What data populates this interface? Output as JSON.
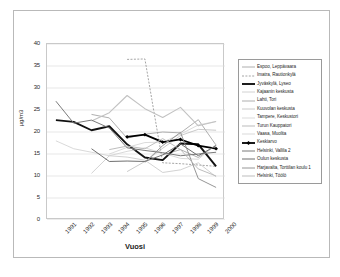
{
  "chart_data": {
    "type": "line",
    "title": "",
    "xlabel": "Vuosi",
    "ylabel": "µg/m3",
    "x": [
      1991,
      1992,
      1993,
      1994,
      1995,
      1996,
      1997,
      1998,
      1999,
      2000
    ],
    "categories": [
      "1991",
      "1992",
      "1993",
      "1994",
      "1995",
      "1996",
      "1997",
      "1998",
      "1999",
      "2000"
    ],
    "ylim": [
      0,
      40
    ],
    "yticks": [
      0,
      5,
      10,
      15,
      20,
      25,
      30,
      35,
      40
    ],
    "grid": "horizontal",
    "legend_position": "right",
    "series": [
      {
        "name": "Espoo, Leppävaara",
        "color": "#9a9a9a",
        "width": 0.8,
        "dash": "",
        "marker": "none",
        "values": [
          null,
          null,
          null,
          null,
          null,
          null,
          14.8,
          16.0,
          14.2,
          17.0
        ]
      },
      {
        "name": "Imatra, Rautionkylä",
        "color": "#8e8e8e",
        "width": 0.8,
        "dash": "2,1.4",
        "marker": "none",
        "values": [
          null,
          null,
          null,
          null,
          36.5,
          36.6,
          13.0,
          12.8,
          12.5,
          12.2
        ]
      },
      {
        "name": "Jyväskylä, Lyseo",
        "color": "#111111",
        "width": 1.9,
        "dash": "",
        "marker": "none",
        "values": [
          22.7,
          22.3,
          20.4,
          21.3,
          17.2,
          14.2,
          13.6,
          17.4,
          17.2,
          12.2
        ]
      },
      {
        "name": "Kajaanin keskusta",
        "color": "#c6c6c6",
        "width": 0.8,
        "dash": "",
        "marker": "none",
        "values": [
          null,
          null,
          10.6,
          14.6,
          14.3,
          13.6,
          10.8,
          11.4,
          13.0,
          9.8
        ]
      },
      {
        "name": "Lahti, Tori",
        "color": "#a6a6a6",
        "width": 0.9,
        "dash": "",
        "marker": "none",
        "values": [
          null,
          null,
          24.0,
          23.2,
          18.6,
          19.5,
          20.0,
          19.8,
          22.8,
          17.0
        ]
      },
      {
        "name": "Kuuvolan keskusta",
        "color": "#bdbdbd",
        "width": 0.8,
        "dash": "",
        "marker": "none",
        "values": [
          null,
          null,
          null,
          null,
          11.0,
          13.3,
          16.3,
          19.2,
          20.6,
          20.4
        ]
      },
      {
        "name": "Tampere, Keskustori",
        "color": "#d2d2d2",
        "width": 0.8,
        "dash": "",
        "marker": "none",
        "values": [
          null,
          null,
          null,
          15.0,
          16.5,
          17.6,
          17.7,
          19.5,
          21.6,
          22.4
        ]
      },
      {
        "name": "Turun Kauppatori",
        "color": "#c2c2c2",
        "width": 1.1,
        "dash": "",
        "marker": "none",
        "values": [
          null,
          null,
          22.5,
          24.4,
          28.3,
          25.3,
          23.3,
          25.6,
          21.4,
          22.4
        ]
      },
      {
        "name": "Vaasa, Muolita",
        "color": "#cfcfcf",
        "width": 0.8,
        "dash": "",
        "marker": "none",
        "values": [
          18.0,
          16.2,
          15.4,
          14.6,
          15.6,
          16.4,
          15.2,
          14.0,
          13.8,
          17.2
        ]
      },
      {
        "name": "Keskiarvo",
        "color": "#000000",
        "width": 1.8,
        "dash": "",
        "marker": "diamond",
        "values": [
          null,
          null,
          null,
          null,
          18.9,
          19.4,
          17.7,
          18.3,
          16.9,
          16.2
        ]
      },
      {
        "name": "Helsinki, Vallila 2",
        "color": "#7b7b7b",
        "width": 1.0,
        "dash": "",
        "marker": "none",
        "values": [
          27.0,
          22.0,
          22.7,
          20.9,
          16.4,
          15.8,
          15.3,
          14.6,
          15.0,
          15.4
        ]
      },
      {
        "name": "Oulun keskusta",
        "color": "#6f6f6f",
        "width": 1.0,
        "dash": "",
        "marker": "none",
        "values": [
          null,
          null,
          16.2,
          13.3,
          13.4,
          13.3,
          14.8,
          17.3,
          14.6,
          16.9
        ]
      },
      {
        "name": "Harjavalta, Torttilan koulu 1",
        "color": "#8a8a8a",
        "width": 0.9,
        "dash": "",
        "marker": "none",
        "values": [
          null,
          null,
          null,
          null,
          null,
          13.1,
          16.9,
          19.9,
          9.4,
          7.4
        ]
      },
      {
        "name": "Helsinki, Töölö",
        "color": "#b5b5b5",
        "width": 0.9,
        "dash": "",
        "marker": "none",
        "values": [
          null,
          null,
          null,
          16.0,
          16.8,
          16.2,
          18.5,
          16.0,
          11.6,
          10.0
        ]
      }
    ]
  }
}
